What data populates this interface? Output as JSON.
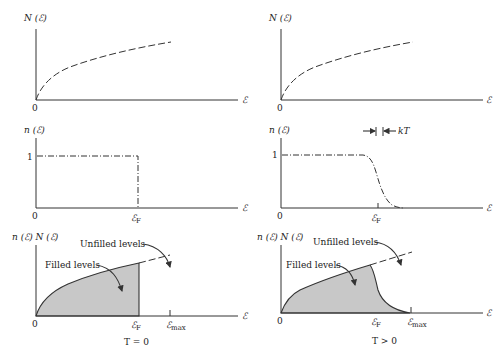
{
  "figure": {
    "columns": [
      {
        "condition_label": "T = 0",
        "panels": [
          {
            "ylabel": "N (ℰ)",
            "origin": "0",
            "xlabel": "ℰ",
            "curve": "density of states (dashed)"
          },
          {
            "ylabel": "n (ℰ)",
            "origin": "0",
            "xlabel": "ℰ",
            "y_tick": "1",
            "x_tick": "ℰ",
            "x_tick_sub": "F",
            "curve": "occupation step (dash-dot)"
          },
          {
            "ylabel": "n (ℰ) N (ℰ)",
            "origin": "0",
            "xlabel": "ℰ",
            "x_tick_F": "ℰ",
            "x_tick_F_sub": "F",
            "x_tick_max": "ℰ",
            "x_tick_max_sub": "max",
            "filled_label": "Filled levels",
            "unfilled_label": "Unfilled levels"
          }
        ]
      },
      {
        "condition_label": "T > 0",
        "panels": [
          {
            "ylabel": "N (ℰ)",
            "origin": "0",
            "xlabel": "ℰ",
            "curve": "density of states (dashed)"
          },
          {
            "ylabel": "n (ℰ)",
            "origin": "0",
            "xlabel": "ℰ",
            "y_tick": "1",
            "x_tick": "ℰ",
            "x_tick_sub": "F",
            "width_label": "kT",
            "curve": "Fermi-Dirac (dash-dot)"
          },
          {
            "ylabel": "n (ℰ) N (ℰ)",
            "origin": "0",
            "xlabel": "ℰ",
            "x_tick_F": "ℰ",
            "x_tick_F_sub": "F",
            "x_tick_max": "ℰ",
            "x_tick_max_sub": "max",
            "filled_label": "Filled levels",
            "unfilled_label": "Unfilled levels"
          }
        ]
      }
    ]
  },
  "colors": {
    "line": "#333333",
    "fill": "#c8c8c8",
    "background": "#ffffff"
  }
}
